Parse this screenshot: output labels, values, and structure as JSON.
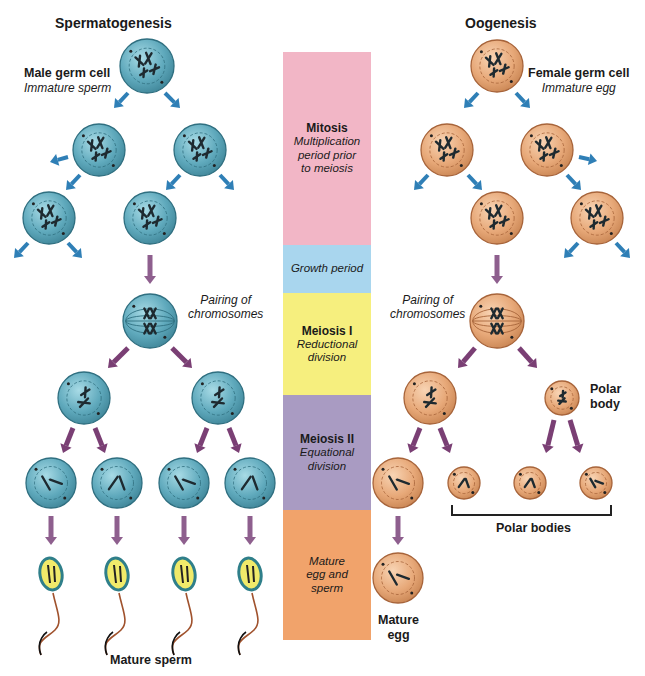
{
  "titles": {
    "left": "Spermatogenesis",
    "right": "Oogenesis"
  },
  "colors": {
    "male_cell_fill": "#5fa9bc",
    "male_cell_stroke": "#2f6f80",
    "female_cell_fill": "#e7a878",
    "female_cell_stroke": "#a7643a",
    "mitosis_arrow": "#2f7fb6",
    "meiosis_arrow": "#7a3f74",
    "maturation_arrow": "#8e5f8e",
    "sperm_head": "#f0ea6a",
    "sperm_head_border": "#2f7f8a",
    "sperm_tail": "#a0522d"
  },
  "left_labels": {
    "germ_cell_title": "Male germ cell",
    "germ_cell_subtitle": "Immature sperm",
    "pairing": [
      "Pairing of",
      "chromosomes"
    ],
    "mature": "Mature sperm"
  },
  "right_labels": {
    "germ_cell_title": "Female germ cell",
    "germ_cell_subtitle": "Immature egg",
    "pairing": [
      "Pairing of",
      "chromosomes"
    ],
    "polar_body": [
      "Polar",
      "body"
    ],
    "polar_bodies": "Polar bodies",
    "mature_egg": [
      "Mature",
      "egg"
    ]
  },
  "stages": [
    {
      "name": "Mitosis",
      "description": [
        "Multiplication",
        "period prior",
        "to meiosis"
      ],
      "color": "#f2b6c6"
    },
    {
      "name": "",
      "description": [
        "Growth period"
      ],
      "color": "#a9d6ee"
    },
    {
      "name": "Meiosis I",
      "description": [
        "Reductional",
        "division"
      ],
      "color": "#f6ef7e"
    },
    {
      "name": "Meiosis II",
      "description": [
        "Equational",
        "division"
      ],
      "color": "#a99bc2"
    },
    {
      "name": "",
      "description": [
        "Mature",
        "egg and",
        "sperm"
      ],
      "color": "#f1a36b"
    }
  ]
}
